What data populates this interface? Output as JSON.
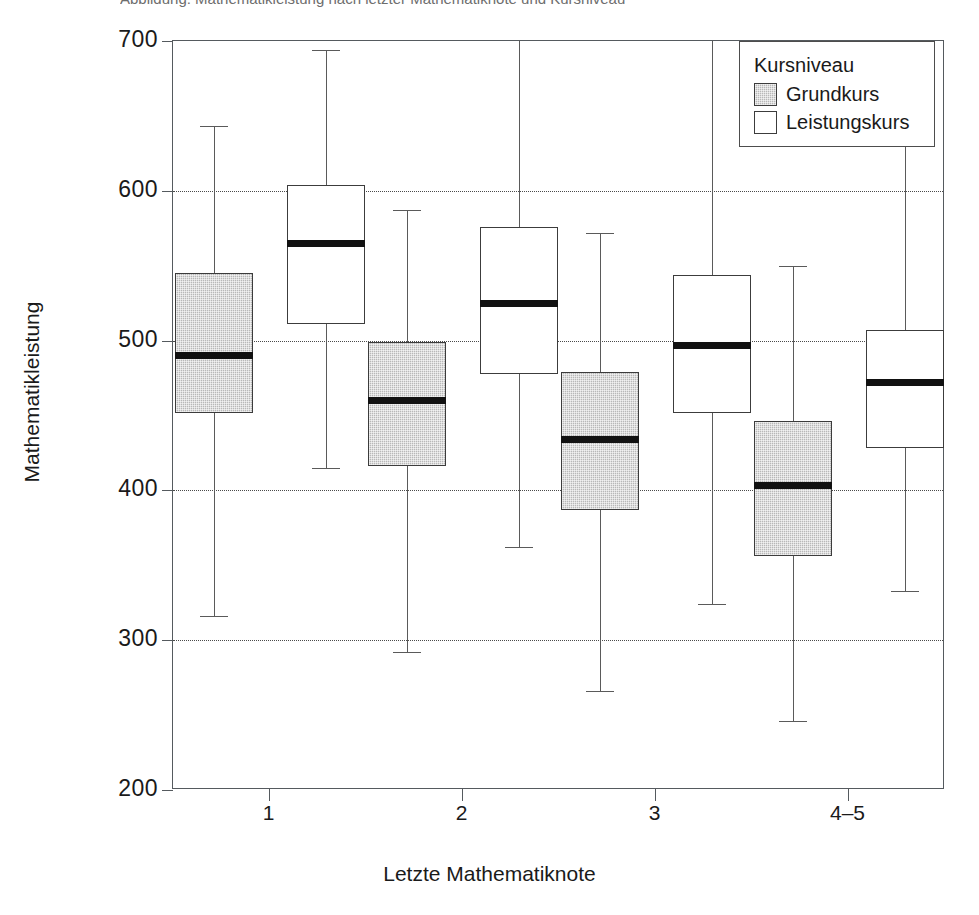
{
  "top_caption_remnant": "Abbildung: Mathematikleistung nach letzter Mathematiknote und Kursniveau",
  "legend": {
    "title": "Kursniveau",
    "entries": [
      {
        "label": "Grundkurs",
        "color": "#b8b8b8",
        "swatch": "grund"
      },
      {
        "label": "Leistungskurs",
        "color": "#ffffff",
        "swatch": "leistung"
      }
    ]
  },
  "chart_data": {
    "type": "box",
    "title": "",
    "xlabel": "Letzte Mathematiknote",
    "ylabel": "Mathematikleistung",
    "categories": [
      "1",
      "2",
      "3",
      "4–5"
    ],
    "ylim": [
      200,
      700
    ],
    "yticks": [
      200,
      300,
      400,
      500,
      600,
      700
    ],
    "ytick_labels": [
      "200",
      "300",
      "400",
      "500",
      "600",
      "700"
    ],
    "grid": "horizontal-dotted",
    "legend_position": "top-right",
    "series": [
      {
        "name": "Grundkurs",
        "color": "#b8b8b8",
        "boxes": [
          {
            "category": "1",
            "whisker_low": 316,
            "q1": 452,
            "median": 490,
            "q3": 545,
            "whisker_high": 643
          },
          {
            "category": "2",
            "whisker_low": 292,
            "q1": 416,
            "median": 460,
            "q3": 499,
            "whisker_high": 587
          },
          {
            "category": "3",
            "whisker_low": 266,
            "q1": 387,
            "median": 434,
            "q3": 479,
            "whisker_high": 572
          },
          {
            "category": "4–5",
            "whisker_low": 246,
            "q1": 356,
            "median": 403,
            "q3": 446,
            "whisker_high": 550
          }
        ]
      },
      {
        "name": "Leistungskurs",
        "color": "#ffffff",
        "boxes": [
          {
            "category": "1",
            "whisker_low": 415,
            "q1": 511,
            "median": 565,
            "q3": 604,
            "whisker_high": 694
          },
          {
            "category": "2",
            "whisker_low": 362,
            "q1": 478,
            "median": 525,
            "q3": 576,
            "whisker_high": 703
          },
          {
            "category": "3",
            "whisker_low": 324,
            "q1": 452,
            "median": 497,
            "q3": 544,
            "whisker_high": 712
          },
          {
            "category": "4–5",
            "whisker_low": 333,
            "q1": 428,
            "median": 472,
            "q3": 507,
            "whisker_high": 683
          }
        ]
      }
    ]
  }
}
